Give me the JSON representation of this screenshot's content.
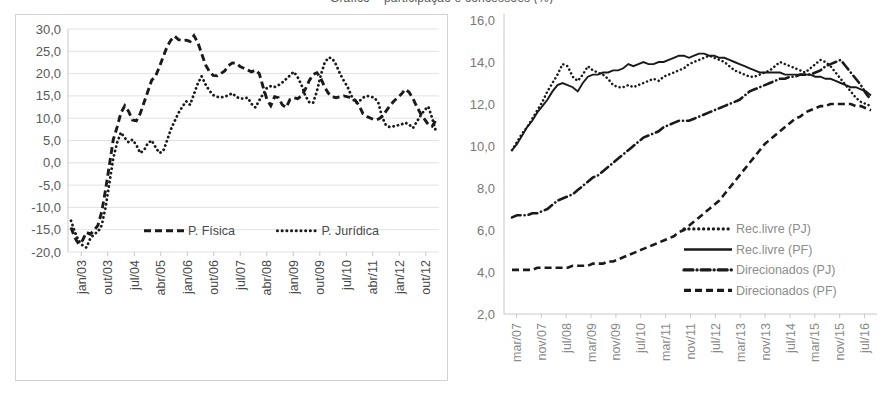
{
  "figure": {
    "clipped_title": "Gráfico – participação e concessões (%)",
    "panels": [
      "left-chart",
      "right-chart"
    ]
  },
  "chart_data": [
    {
      "id": "left-chart",
      "type": "line",
      "title": "",
      "xlabel": "",
      "ylabel": "",
      "ylim": [
        -20.0,
        30.0
      ],
      "ytick_labels": [
        "30,0",
        "25,0",
        "20,0",
        "15,0",
        "10,0",
        "5,0",
        "0,0",
        "-5,0",
        "-10,0",
        "-15,0",
        "-20,0"
      ],
      "ytick_values": [
        30.0,
        25.0,
        20.0,
        15.0,
        10.0,
        5.0,
        0.0,
        -5.0,
        -10.0,
        -15.0,
        -20.0
      ],
      "grid": true,
      "legend_position": "inside-bottom",
      "categories": [
        "jan/03",
        "out/03",
        "jul/04",
        "abr/05",
        "jan/06",
        "out/06",
        "jul/07",
        "abr/08",
        "jan/09",
        "out/09",
        "jul/10",
        "abr/11",
        "jan/12",
        "out/12"
      ],
      "xtick_labels": [
        "jan/03",
        "out/03",
        "jul/04",
        "abr/05",
        "jan/06",
        "out/06",
        "jul/07",
        "abr/08",
        "jan/09",
        "out/09",
        "jul/10",
        "abr/11",
        "jan/12",
        "out/12"
      ],
      "series": [
        {
          "name": "P. Física",
          "style": "dashed",
          "values": [
            -14.5,
            -16.8,
            -18.2,
            -17.4,
            -15.6,
            -16.0,
            -15.2,
            -14.0,
            -11.0,
            -6.0,
            -0.5,
            5.2,
            8.0,
            11.2,
            12.8,
            11.5,
            9.6,
            9.4,
            11.0,
            13.5,
            16.0,
            18.5,
            19.4,
            21.5,
            23.8,
            26.0,
            27.5,
            28.4,
            27.6,
            27.4,
            27.5,
            27.2,
            28.5,
            27.0,
            24.5,
            22.0,
            20.5,
            19.6,
            19.5,
            20.0,
            20.6,
            21.8,
            22.4,
            22.3,
            21.6,
            21.2,
            20.8,
            20.4,
            20.8,
            20.0,
            17.0,
            14.2,
            12.8,
            14.8,
            14.6,
            13.0,
            12.4,
            14.2,
            14.6,
            14.4,
            15.0,
            16.5,
            18.4,
            19.8,
            20.2,
            19.0,
            17.0,
            15.6,
            14.8,
            14.6,
            14.8,
            15.0,
            14.8,
            14.6,
            14.0,
            12.8,
            11.0,
            10.4,
            10.0,
            9.6,
            9.8,
            10.4,
            11.6,
            12.8,
            13.8,
            14.6,
            15.4,
            16.5,
            15.8,
            14.4,
            12.6,
            11.0,
            9.8,
            8.6,
            8.2,
            9.6
          ]
        },
        {
          "name": "P. Jurídica",
          "style": "dotted",
          "values": [
            -13.0,
            -15.5,
            -17.5,
            -18.5,
            -19.0,
            -17.0,
            -16.0,
            -15.5,
            -14.0,
            -10.0,
            -4.5,
            1.0,
            4.5,
            6.8,
            5.6,
            4.6,
            5.2,
            4.0,
            2.2,
            2.8,
            4.4,
            5.0,
            3.5,
            2.2,
            2.6,
            5.0,
            7.5,
            9.4,
            11.2,
            12.6,
            13.8,
            13.0,
            15.4,
            17.8,
            19.4,
            17.6,
            16.2,
            15.2,
            14.8,
            14.7,
            14.8,
            15.2,
            15.6,
            14.8,
            14.4,
            14.4,
            14.6,
            13.2,
            12.4,
            14.0,
            15.4,
            16.8,
            17.2,
            17.0,
            17.4,
            18.0,
            18.8,
            19.6,
            20.4,
            19.2,
            17.4,
            15.0,
            13.6,
            13.4,
            16.0,
            19.6,
            22.4,
            23.6,
            23.4,
            22.0,
            20.0,
            18.4,
            17.0,
            15.0,
            13.4,
            13.8,
            14.6,
            15.0,
            14.8,
            14.6,
            13.4,
            10.2,
            8.4,
            8.0,
            8.2,
            8.4,
            8.6,
            9.0,
            8.6,
            7.8,
            9.2,
            10.6,
            11.8,
            12.6,
            10.0,
            7.0
          ]
        }
      ]
    },
    {
      "id": "right-chart",
      "type": "line",
      "title": "",
      "xlabel": "",
      "ylabel": "",
      "ylim": [
        2.0,
        16.0
      ],
      "ytick_labels": [
        "16,0",
        "14,0",
        "12,0",
        "10,0",
        "8,0",
        "6,0",
        "4,0",
        "2,0"
      ],
      "ytick_values": [
        16.0,
        14.0,
        12.0,
        10.0,
        8.0,
        6.0,
        4.0,
        2.0
      ],
      "grid": false,
      "legend_position": "inside-right",
      "categories": [
        "mar/07",
        "nov/07",
        "jul/08",
        "mar/09",
        "nov/09",
        "jul/10",
        "mar/11",
        "nov/11",
        "jul/12",
        "mar/13",
        "nov/13",
        "jul/14",
        "mar/15",
        "nov/15",
        "jul/16"
      ],
      "xtick_labels": [
        "mar/07",
        "nov/07",
        "jul/08",
        "mar/09",
        "nov/09",
        "jul/10",
        "mar/11",
        "nov/11",
        "jul/12",
        "mar/13",
        "nov/13",
        "jul/14",
        "mar/15",
        "nov/15",
        "jul/16"
      ],
      "series": [
        {
          "name": "Rec.livre (PJ)",
          "style": "dotted",
          "values": [
            9.8,
            10.2,
            10.6,
            10.9,
            11.3,
            11.7,
            12.1,
            12.6,
            13.0,
            13.4,
            13.9,
            13.8,
            13.3,
            13.1,
            13.4,
            13.8,
            13.6,
            13.5,
            13.4,
            13.2,
            12.9,
            12.8,
            12.8,
            12.9,
            12.8,
            12.9,
            13.0,
            13.1,
            13.2,
            13.1,
            13.3,
            13.4,
            13.5,
            13.6,
            13.7,
            13.9,
            14.0,
            14.1,
            14.2,
            14.3,
            14.2,
            14.1,
            14.0,
            13.8,
            13.6,
            13.5,
            13.4,
            13.3,
            13.3,
            13.4,
            13.5,
            13.6,
            13.8,
            14.0,
            13.9,
            13.8,
            13.7,
            13.6,
            13.5,
            13.7,
            13.9,
            14.1,
            14.0,
            13.8,
            13.5,
            13.2,
            12.9,
            12.6,
            12.3,
            12.1,
            12.0,
            11.9
          ]
        },
        {
          "name": "Rec.livre (PF)",
          "style": "solid",
          "values": [
            9.8,
            10.1,
            10.5,
            10.9,
            11.2,
            11.6,
            11.9,
            12.2,
            12.6,
            12.9,
            13.0,
            12.9,
            12.8,
            12.6,
            13.0,
            13.3,
            13.4,
            13.4,
            13.5,
            13.5,
            13.6,
            13.6,
            13.7,
            13.9,
            13.8,
            13.9,
            14.0,
            13.9,
            13.9,
            14.0,
            14.0,
            14.1,
            14.2,
            14.3,
            14.3,
            14.2,
            14.3,
            14.4,
            14.4,
            14.3,
            14.3,
            14.2,
            14.2,
            14.1,
            14.0,
            13.9,
            13.8,
            13.7,
            13.6,
            13.5,
            13.5,
            13.5,
            13.5,
            13.5,
            13.4,
            13.4,
            13.4,
            13.4,
            13.4,
            13.4,
            13.3,
            13.3,
            13.2,
            13.2,
            13.1,
            13.0,
            12.9,
            12.8,
            12.8,
            12.7,
            12.6,
            12.4
          ]
        },
        {
          "name": "Direcionados (PJ)",
          "style": "dashdot",
          "values": [
            6.6,
            6.7,
            6.7,
            6.7,
            6.8,
            6.8,
            6.9,
            7.0,
            7.2,
            7.4,
            7.5,
            7.6,
            7.7,
            7.9,
            8.1,
            8.3,
            8.5,
            8.6,
            8.8,
            9.0,
            9.2,
            9.4,
            9.6,
            9.8,
            10.0,
            10.2,
            10.4,
            10.5,
            10.6,
            10.7,
            10.9,
            11.0,
            11.1,
            11.2,
            11.2,
            11.2,
            11.3,
            11.4,
            11.5,
            11.6,
            11.7,
            11.8,
            11.9,
            12.0,
            12.1,
            12.2,
            12.4,
            12.6,
            12.7,
            12.8,
            12.9,
            13.0,
            13.1,
            13.2,
            13.2,
            13.3,
            13.3,
            13.4,
            13.4,
            13.4,
            13.5,
            13.6,
            13.8,
            13.9,
            14.0,
            14.1,
            13.8,
            13.5,
            13.2,
            12.9,
            12.5,
            12.2
          ]
        },
        {
          "name": "Direcionados (PF)",
          "style": "dashed",
          "values": [
            4.1,
            4.1,
            4.1,
            4.1,
            4.1,
            4.2,
            4.2,
            4.2,
            4.2,
            4.2,
            4.2,
            4.2,
            4.3,
            4.3,
            4.3,
            4.3,
            4.4,
            4.4,
            4.4,
            4.5,
            4.5,
            4.6,
            4.7,
            4.8,
            4.9,
            5.0,
            5.1,
            5.2,
            5.3,
            5.4,
            5.5,
            5.6,
            5.7,
            5.9,
            6.0,
            6.2,
            6.4,
            6.6,
            6.8,
            7.0,
            7.2,
            7.4,
            7.7,
            8.0,
            8.3,
            8.6,
            8.9,
            9.2,
            9.5,
            9.8,
            10.1,
            10.3,
            10.5,
            10.7,
            10.9,
            11.1,
            11.3,
            11.4,
            11.6,
            11.7,
            11.8,
            11.9,
            11.9,
            12.0,
            12.0,
            12.0,
            12.0,
            12.0,
            11.9,
            11.9,
            11.8,
            11.7
          ]
        }
      ]
    }
  ]
}
